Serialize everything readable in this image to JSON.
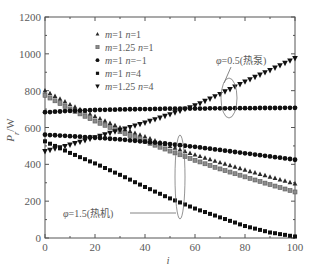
{
  "chart_data": {
    "type": "scatter",
    "title": "",
    "xlabel": "i",
    "ylabel": "P_r/W",
    "xlabel_parts": [
      {
        "t": "i",
        "i": true
      }
    ],
    "ylabel_parts": [
      {
        "t": "P",
        "i": true
      },
      {
        "t": "r",
        "i": true,
        "sub": true
      },
      {
        "t": "/W"
      }
    ],
    "xlim": [
      0,
      100
    ],
    "ylim": [
      0,
      1200
    ],
    "x_ticks": [
      0,
      20,
      40,
      60,
      80,
      100
    ],
    "y_ticks": [
      0,
      200,
      400,
      600,
      800,
      1000,
      1200
    ],
    "x_minor_tick_step": 10,
    "y_minor_tick_step": 100,
    "grid": false,
    "legend_position": "top-left",
    "legend": [
      {
        "marker": "triangle-up",
        "parts": [
          {
            "t": "m",
            "i": true
          },
          {
            "t": "=1  "
          },
          {
            "t": "n",
            "i": true
          },
          {
            "t": "=1"
          }
        ]
      },
      {
        "marker": "square-grey",
        "parts": [
          {
            "t": "m",
            "i": true
          },
          {
            "t": "=1.25  "
          },
          {
            "t": "n",
            "i": true
          },
          {
            "t": "=1"
          }
        ]
      },
      {
        "marker": "circle",
        "parts": [
          {
            "t": "m",
            "i": true
          },
          {
            "t": "=1  "
          },
          {
            "t": "n",
            "i": true
          },
          {
            "t": "=−1"
          }
        ]
      },
      {
        "marker": "square",
        "parts": [
          {
            "t": "m",
            "i": true
          },
          {
            "t": "=1  "
          },
          {
            "t": "n",
            "i": true
          },
          {
            "t": "=4"
          }
        ]
      },
      {
        "marker": "triangle-down",
        "parts": [
          {
            "t": "m",
            "i": true
          },
          {
            "t": "=1.25  "
          },
          {
            "t": "n",
            "i": true
          },
          {
            "t": "=4"
          }
        ]
      }
    ],
    "x": [
      0,
      2,
      4,
      6,
      8,
      10,
      12,
      14,
      16,
      18,
      20,
      22,
      24,
      26,
      28,
      30,
      32,
      34,
      36,
      38,
      40,
      42,
      44,
      46,
      48,
      50,
      52,
      54,
      56,
      58,
      60,
      62,
      64,
      66,
      68,
      70,
      72,
      74,
      76,
      78,
      80,
      82,
      84,
      86,
      88,
      90,
      92,
      94,
      96,
      98,
      100
    ],
    "series": [
      {
        "id": "m1-n1",
        "name": "m=1 n=1",
        "marker": "triangle-up",
        "group": "phi=1.5",
        "values": [
          800,
          785,
          770,
          755,
          740,
          725,
          712,
          699,
          686,
          673,
          660,
          648,
          636,
          624,
          612,
          600,
          590,
          580,
          570,
          560,
          550,
          540,
          529,
          519,
          508,
          498,
          489,
          480,
          470,
          461,
          452,
          444,
          435,
          427,
          418,
          410,
          402,
          394,
          386,
          378,
          370,
          362,
          355,
          347,
          340,
          332,
          325,
          317,
          310,
          302,
          295
        ]
      },
      {
        "id": "m1.25-n1",
        "name": "m=1.25 n=1",
        "marker": "square-grey",
        "group": "phi=1.5",
        "values": [
          775,
          760,
          745,
          730,
          715,
          700,
          687,
          674,
          661,
          648,
          635,
          623,
          612,
          600,
          589,
          577,
          567,
          556,
          546,
          535,
          525,
          514,
          504,
          493,
          483,
          472,
          462,
          452,
          442,
          432,
          422,
          413,
          403,
          394,
          384,
          375,
          366,
          358,
          349,
          341,
          332,
          324,
          315,
          307,
          298,
          290,
          282,
          274,
          266,
          258,
          250
        ]
      },
      {
        "id": "m1-n-1-upper",
        "name": "m=1 n=-1",
        "marker": "circle",
        "group": "phi=0.5",
        "values": [
          683,
          684,
          686,
          687,
          689,
          690,
          691,
          692,
          693,
          694,
          695,
          696,
          696,
          697,
          697,
          698,
          698,
          699,
          699,
          700,
          700,
          700,
          701,
          701,
          702,
          702,
          702,
          702,
          703,
          703,
          703,
          703,
          703,
          704,
          704,
          704,
          704,
          704,
          705,
          705,
          705,
          705,
          705,
          706,
          706,
          706,
          706,
          706,
          707,
          707,
          707
        ]
      },
      {
        "id": "m1-n-1-lower",
        "name": "m=1 n=-1",
        "marker": "circle",
        "group": "phi=1.5",
        "values": [
          561,
          559,
          558,
          556,
          555,
          553,
          551,
          550,
          548,
          547,
          545,
          543,
          541,
          539,
          537,
          535,
          533,
          530,
          528,
          525,
          523,
          520,
          518,
          515,
          513,
          510,
          507,
          504,
          501,
          498,
          495,
          492,
          488,
          485,
          481,
          478,
          474,
          471,
          467,
          464,
          460,
          457,
          453,
          450,
          446,
          443,
          439,
          436,
          432,
          429,
          425
        ]
      },
      {
        "id": "m1-n4",
        "name": "m=1 n=4",
        "marker": "square",
        "group": "phi=1.5",
        "values": [
          525,
          512,
          500,
          487,
          475,
          462,
          451,
          439,
          428,
          416,
          405,
          393,
          380,
          368,
          355,
          343,
          330,
          317,
          303,
          290,
          277,
          265,
          252,
          240,
          227,
          215,
          204,
          193,
          182,
          171,
          160,
          150,
          141,
          131,
          122,
          112,
          103,
          93,
          84,
          74,
          65,
          58,
          51,
          44,
          37,
          30,
          26,
          21,
          17,
          12,
          8
        ]
      },
      {
        "id": "m1.25-n4",
        "name": "m=1.25 n=4",
        "marker": "triangle-down",
        "group": "phi=0.5",
        "values": [
          470,
          477,
          484,
          491,
          498,
          505,
          513,
          521,
          529,
          537,
          545,
          553,
          561,
          569,
          577,
          585,
          593,
          601,
          609,
          617,
          625,
          634,
          643,
          652,
          661,
          670,
          680,
          689,
          699,
          708,
          718,
          730,
          743,
          755,
          768,
          780,
          794,
          807,
          821,
          834,
          848,
          860,
          873,
          885,
          898,
          910,
          923,
          936,
          949,
          962,
          975
        ]
      }
    ],
    "annotations": [
      {
        "id": "phi-0.5",
        "parts": [
          {
            "t": "φ",
            "i": true
          },
          {
            "t": "=0.5(热泵)"
          }
        ]
      },
      {
        "id": "phi-1.5",
        "parts": [
          {
            "t": "φ",
            "i": true
          },
          {
            "t": "=1.5(热机)"
          }
        ]
      }
    ]
  }
}
